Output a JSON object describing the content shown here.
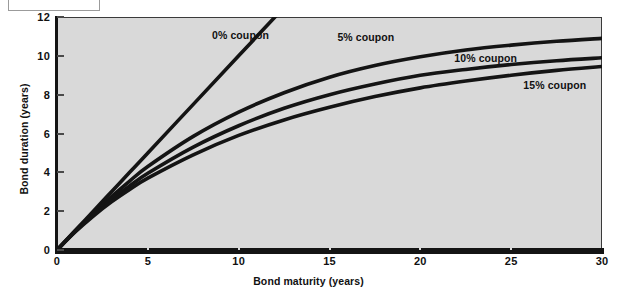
{
  "chart_data": {
    "type": "line",
    "title": "",
    "xlabel": "Bond maturity (years)",
    "ylabel": "Bond duration (years)",
    "xlim": [
      0,
      30
    ],
    "ylim": [
      0,
      12
    ],
    "xticks": [
      0,
      5,
      10,
      15,
      20,
      25,
      30
    ],
    "yticks": [
      0,
      2,
      4,
      6,
      8,
      10,
      12
    ],
    "grid": false,
    "legend_position": "inline-annotations",
    "x": [
      0,
      1,
      2,
      3,
      4,
      5,
      7.5,
      10,
      12.5,
      15,
      17.5,
      20,
      22.5,
      25,
      27.5,
      30
    ],
    "series": [
      {
        "name": "0% coupon",
        "label": "0% coupon",
        "values": [
          0,
          1.0,
          2.0,
          3.0,
          4.0,
          5.0,
          7.5,
          10.0,
          12.5,
          15.0,
          17.5,
          20.0,
          22.5,
          25.0,
          27.5,
          30.0
        ],
        "clipped_at_top": true
      },
      {
        "name": "5% coupon",
        "label": "5% coupon",
        "values": [
          0,
          0.98,
          1.9,
          2.75,
          3.55,
          4.3,
          5.85,
          7.1,
          8.1,
          8.9,
          9.5,
          9.95,
          10.3,
          10.55,
          10.75,
          10.9
        ]
      },
      {
        "name": "10% coupon",
        "label": "10% coupon",
        "values": [
          0,
          0.95,
          1.82,
          2.6,
          3.3,
          3.95,
          5.3,
          6.4,
          7.3,
          8.0,
          8.55,
          9.0,
          9.3,
          9.55,
          9.75,
          9.9
        ]
      },
      {
        "name": "15% coupon",
        "label": "15% coupon",
        "values": [
          0,
          0.93,
          1.75,
          2.48,
          3.12,
          3.7,
          4.9,
          5.9,
          6.7,
          7.35,
          7.9,
          8.35,
          8.7,
          9.0,
          9.25,
          9.45
        ]
      }
    ],
    "annotations": [
      {
        "text": "0% coupon",
        "x": 10.1,
        "y": 11.0
      },
      {
        "text": "5% coupon",
        "x": 17.0,
        "y": 10.9
      },
      {
        "text": "10% coupon",
        "x": 23.6,
        "y": 9.85
      },
      {
        "text": "15% coupon",
        "x": 27.4,
        "y": 8.45
      }
    ],
    "colors": {
      "plot_background": "#d9d9d9",
      "figure_background": "#ffffff",
      "line": "#141414",
      "axis": "#141414",
      "text": "#111111"
    }
  }
}
